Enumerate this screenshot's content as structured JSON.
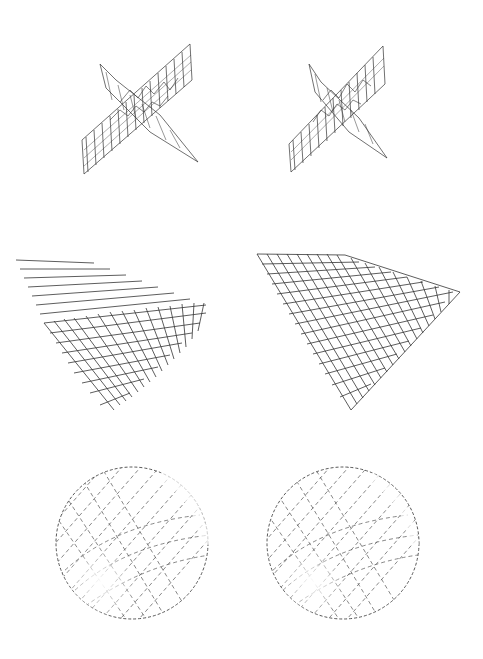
{
  "figure": {
    "background": "#ffffff",
    "line_color": "#222222",
    "layout": "3 rows x 2 columns (stereo pairs)",
    "rows": [
      {
        "name": "crossed-planes",
        "description": "Two intersecting hatched wireframe planes with irregular contour lines",
        "panels": [
          "left",
          "right"
        ]
      },
      {
        "name": "perspective-grid",
        "description": "Square mesh grid plane viewed in perspective",
        "panels": [
          "left",
          "right"
        ]
      },
      {
        "name": "sphere",
        "description": "Hatched wireframe sphere with bright highlight at lower-left",
        "panels": [
          "left",
          "right"
        ]
      }
    ]
  }
}
